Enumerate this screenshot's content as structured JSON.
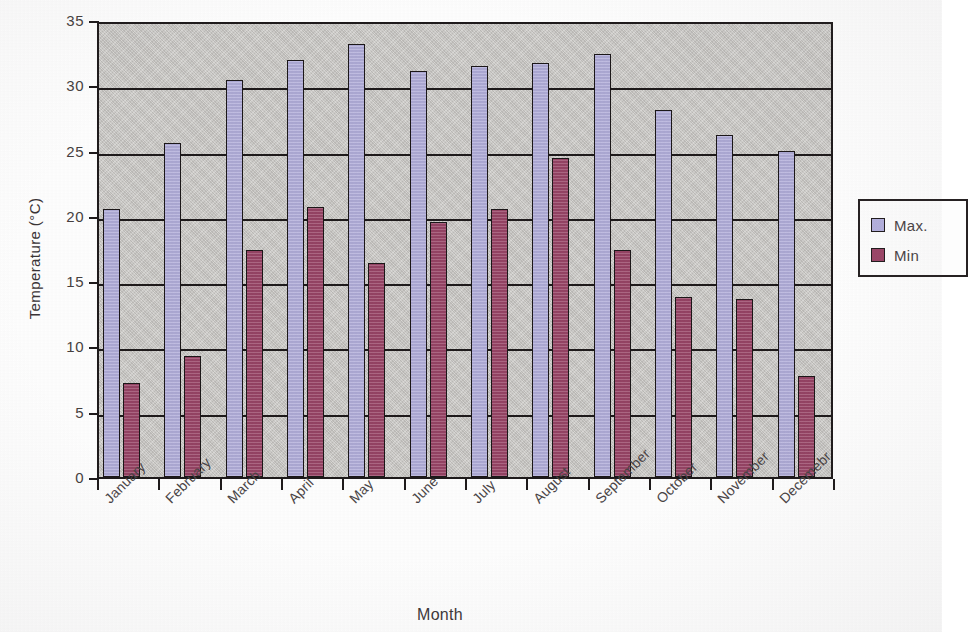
{
  "chart_data": {
    "type": "bar",
    "title": "",
    "xlabel": "Month",
    "ylabel": "Temperature (°C)",
    "ylim": [
      0,
      35
    ],
    "ytick_step": 5,
    "yticks": [
      "35",
      "30",
      "25",
      "20",
      "15",
      "10",
      "5",
      "0"
    ],
    "grid": true,
    "grid_axis": "y",
    "legend_position": "right",
    "plot_background": "#c9c7c4",
    "categories": [
      "January",
      "February",
      "March",
      "April",
      "May",
      "June",
      "July",
      "August",
      "September",
      "October",
      "November",
      "Decemebr"
    ],
    "series": [
      {
        "name": "Max.",
        "color": "#b4b0dd",
        "values": [
          20.5,
          25.6,
          30.4,
          31.9,
          33.2,
          31.1,
          31.5,
          31.7,
          32.4,
          28.1,
          26.2,
          25.0
        ]
      },
      {
        "name": "Min",
        "color": "#9b4668",
        "values": [
          7.2,
          9.3,
          17.4,
          20.7,
          16.4,
          19.5,
          20.5,
          24.4,
          17.4,
          13.8,
          13.6,
          7.7
        ]
      }
    ]
  },
  "legend": {
    "entries": [
      {
        "label": "Max."
      },
      {
        "label": "Min"
      }
    ]
  },
  "axes": {
    "y_title": "Temperature (°C)",
    "x_title": "Month"
  }
}
